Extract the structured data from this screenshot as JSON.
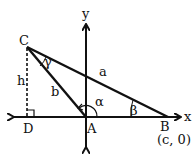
{
  "diagram": {
    "type": "geometry",
    "colors": {
      "stroke": "#111111",
      "background": "#ffffff"
    },
    "axes": {
      "x_label": "x",
      "y_label": "y"
    },
    "points": {
      "A": {
        "label": "A"
      },
      "B": {
        "label": "B",
        "coords": "(c, 0)"
      },
      "C": {
        "label": "C"
      },
      "D": {
        "label": "D"
      }
    },
    "sides": {
      "a": "a",
      "b": "b",
      "h": "h"
    },
    "angles": {
      "alpha": "α",
      "beta": "β",
      "gamma": "γ"
    }
  }
}
